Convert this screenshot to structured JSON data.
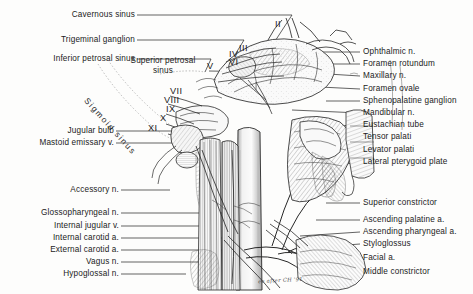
{
  "figure": {
    "ink_color": "#1b1b1b",
    "paper_color": "#fdfdfc",
    "signature": "ee after CH '91"
  },
  "labels_left_top": [
    {
      "text": "Cavernous sinus"
    },
    {
      "text": "Trigeminal ganglion"
    },
    {
      "text": "Inferior petrosal sinus"
    }
  ],
  "labels_inner": {
    "superior_petrosal_line1": "Superior petrosal",
    "superior_petrosal_line2": "sinus",
    "sigmoid_sinus": "Sigmoid sinus"
  },
  "labels_left_mid": [
    {
      "text": "Jugular bulb"
    },
    {
      "text": "Mastoid emissary v."
    }
  ],
  "labels_left_bottom": [
    {
      "text": "Accessory n."
    },
    {
      "text": "Glossopharyngeal n."
    },
    {
      "text": "Internal jugular v."
    },
    {
      "text": "Internal carotid a."
    },
    {
      "text": "External carotid a."
    },
    {
      "text": "Vagus n."
    },
    {
      "text": "Hypoglossal n."
    }
  ],
  "labels_right_top": [
    {
      "text": "Ophthalmic n."
    },
    {
      "text": "Foramen rotundum"
    },
    {
      "text": "Maxillary n."
    },
    {
      "text": "Foramen ovale"
    },
    {
      "text": "Sphenopalatine ganglion"
    },
    {
      "text": "Mandibular n."
    },
    {
      "text": "Eustachian tube"
    },
    {
      "text": "Tensor palati"
    },
    {
      "text": "Levator palati"
    },
    {
      "text": "Lateral pterygoid plate"
    }
  ],
  "labels_right_bottom": [
    {
      "text": "Superior constrictor"
    },
    {
      "text": "Ascending palatine a."
    },
    {
      "text": "Ascending pharyngeal a."
    },
    {
      "text": "Styloglossus"
    },
    {
      "text": "Facial a."
    },
    {
      "text": "Middle constrictor"
    }
  ],
  "cranial_nerve_numerals": [
    {
      "text": "II"
    },
    {
      "text": "III"
    },
    {
      "text": "IV"
    },
    {
      "text": "VI"
    },
    {
      "text": "V"
    },
    {
      "text": "VII"
    },
    {
      "text": "VIII"
    },
    {
      "text": "IX"
    },
    {
      "text": "X"
    },
    {
      "text": "XI"
    }
  ]
}
